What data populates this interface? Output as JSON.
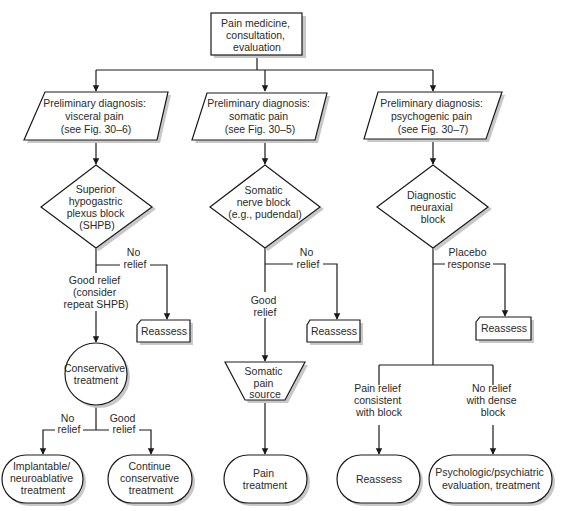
{
  "diagram": {
    "colors": {
      "stroke": "#1a1a1a",
      "shadow": "#c8c8c8",
      "text": "#2a2a2a",
      "background": "#ffffff"
    },
    "nodes": {
      "start": {
        "shape": "rectangle",
        "lines": [
          "Pain medicine,",
          "consultation,",
          "evaluation"
        ]
      },
      "dx_visceral": {
        "shape": "parallelogram",
        "lines": [
          "Preliminary diagnosis:",
          "visceral pain",
          "(see Fig. 30–6)"
        ]
      },
      "dx_somatic": {
        "shape": "parallelogram",
        "lines": [
          "Preliminary diagnosis:",
          "somatic pain",
          "(see Fig. 30–5)"
        ]
      },
      "dx_psychogenic": {
        "shape": "parallelogram",
        "lines": [
          "Preliminary diagnosis:",
          "psychogenic pain",
          "(see Fig. 30–7)"
        ]
      },
      "shpb": {
        "shape": "diamond",
        "lines": [
          "Superior",
          "hypogastric",
          "plexus block",
          "(SHPB)"
        ]
      },
      "somatic_block": {
        "shape": "diamond",
        "lines": [
          "Somatic",
          "nerve block",
          "(e.g., pudendal)"
        ]
      },
      "neuraxial_block": {
        "shape": "diamond",
        "lines": [
          "Diagnostic",
          "neuraxial",
          "block"
        ]
      },
      "reassess_1": {
        "shape": "card",
        "lines": [
          "Reassess"
        ]
      },
      "reassess_2": {
        "shape": "card",
        "lines": [
          "Reassess"
        ]
      },
      "reassess_3": {
        "shape": "card",
        "lines": [
          "Reassess"
        ]
      },
      "conservative": {
        "shape": "circle",
        "lines": [
          "Conservative",
          "treatment"
        ]
      },
      "somatic_source": {
        "shape": "trapezoid",
        "lines": [
          "Somatic",
          "pain",
          "source"
        ]
      },
      "implantable": {
        "shape": "terminator",
        "lines": [
          "Implantable/",
          "neuroablative",
          "treatment"
        ]
      },
      "continue_conservative": {
        "shape": "terminator",
        "lines": [
          "Continue",
          "conservative",
          "treatment"
        ]
      },
      "pain_treatment": {
        "shape": "terminator",
        "lines": [
          "Pain",
          "treatment"
        ]
      },
      "reassess_4": {
        "shape": "terminator",
        "lines": [
          "Reassess"
        ]
      },
      "psych_eval": {
        "shape": "terminator",
        "lines": [
          "Psychologic/psychiatric",
          "evaluation, treatment"
        ]
      }
    },
    "edge_labels": {
      "shpb_no_relief": [
        "No",
        "relief"
      ],
      "shpb_good_relief": [
        "Good relief",
        "(consider",
        "repeat SHPB)"
      ],
      "somatic_no_relief": [
        "No",
        "relief"
      ],
      "somatic_good_relief": [
        "Good",
        "relief"
      ],
      "neuraxial_placebo": [
        "Placebo",
        "response"
      ],
      "conservative_no_relief": [
        "No",
        "relief"
      ],
      "conservative_good_relief": [
        "Good",
        "relief"
      ],
      "neuraxial_consistent": [
        "Pain relief",
        "consistent",
        "with block"
      ],
      "neuraxial_no_relief_dense": [
        "No relief",
        "with dense",
        "block"
      ]
    }
  }
}
